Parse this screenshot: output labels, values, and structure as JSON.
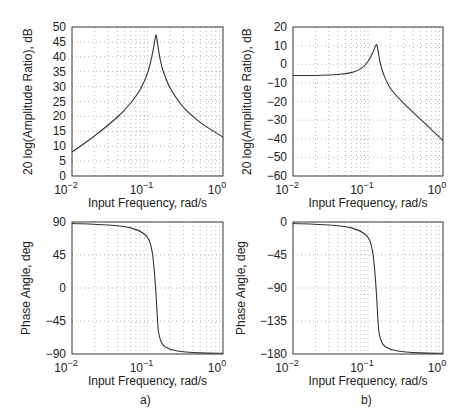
{
  "chart_data": [
    {
      "id": "a-magnitude",
      "type": "line",
      "panel": "a)",
      "title": "",
      "xlabel": "Input Frequency, rad/s",
      "ylabel": "20 log(Amplitude Ratio), dB",
      "xscale": "log",
      "xlim": [
        0.01,
        1
      ],
      "ylim": [
        0,
        50
      ],
      "xticks": [
        "10^-2",
        "10^-1",
        "10^0"
      ],
      "yticks": [
        0,
        5,
        10,
        15,
        20,
        25,
        30,
        35,
        40,
        45,
        50
      ],
      "grid": true,
      "x": [
        0.01,
        0.02,
        0.04,
        0.06,
        0.08,
        0.1,
        0.115,
        0.125,
        0.13,
        0.135,
        0.145,
        0.16,
        0.2,
        0.3,
        0.5,
        1.0
      ],
      "y": [
        8,
        13.5,
        19.8,
        24.5,
        29,
        34.5,
        40.5,
        45.5,
        47.3,
        45,
        40,
        35.5,
        29.5,
        23,
        18,
        13
      ]
    },
    {
      "id": "b-magnitude",
      "type": "line",
      "panel": "b)",
      "title": "",
      "xlabel": "Input Frequency, rad/s",
      "ylabel": "20 log(Amplitude Ratio), dB",
      "xscale": "log",
      "xlim": [
        0.01,
        1
      ],
      "ylim": [
        -60,
        20
      ],
      "xticks": [
        "10^-2",
        "10^-1",
        "10^0"
      ],
      "yticks": [
        20,
        10,
        0,
        -10,
        -20,
        -30,
        -40,
        -50,
        -60
      ],
      "grid": true,
      "x": [
        0.01,
        0.02,
        0.04,
        0.06,
        0.08,
        0.1,
        0.115,
        0.125,
        0.13,
        0.135,
        0.145,
        0.16,
        0.2,
        0.3,
        0.5,
        1.0
      ],
      "y": [
        -6,
        -6,
        -5.5,
        -4.5,
        -2.5,
        1.5,
        6,
        9.5,
        10.5,
        8,
        1,
        -5,
        -13,
        -21,
        -29.5,
        -41
      ]
    },
    {
      "id": "a-phase",
      "type": "line",
      "panel": "a)",
      "title": "",
      "xlabel": "Input Frequency, rad/s",
      "ylabel": "Phase Angle, deg",
      "xscale": "log",
      "xlim": [
        0.01,
        1
      ],
      "ylim": [
        -90,
        90
      ],
      "xticks": [
        "10^-2",
        "10^-1",
        "10^0"
      ],
      "yticks": [
        90,
        45,
        0,
        -45,
        -90
      ],
      "grid": true,
      "x": [
        0.01,
        0.03,
        0.06,
        0.09,
        0.105,
        0.115,
        0.12,
        0.125,
        0.13,
        0.135,
        0.14,
        0.15,
        0.17,
        0.25,
        0.5,
        1.0
      ],
      "y": [
        88,
        86,
        82,
        74,
        65,
        50,
        35,
        15,
        -10,
        -40,
        -60,
        -72,
        -80,
        -86,
        -88.5,
        -89
      ]
    },
    {
      "id": "b-phase",
      "type": "line",
      "panel": "b)",
      "title": "",
      "xlabel": "Input Frequency, rad/s",
      "ylabel": "Phase Angle, deg",
      "xscale": "log",
      "xlim": [
        0.01,
        1
      ],
      "ylim": [
        -180,
        0
      ],
      "xticks": [
        "10^-2",
        "10^-1",
        "10^0"
      ],
      "yticks": [
        0,
        -45,
        -90,
        -135,
        -180
      ],
      "grid": true,
      "x": [
        0.01,
        0.03,
        0.06,
        0.09,
        0.105,
        0.115,
        0.12,
        0.125,
        0.13,
        0.135,
        0.14,
        0.15,
        0.17,
        0.25,
        0.5,
        1.0
      ],
      "y": [
        -2,
        -4,
        -8,
        -16,
        -25,
        -40,
        -55,
        -75,
        -100,
        -130,
        -150,
        -162,
        -170,
        -176,
        -178.5,
        -179
      ]
    }
  ],
  "captions": {
    "left": "a)",
    "right": "b)"
  },
  "layout_boxes": [
    {
      "x": 72,
      "y": 27,
      "w": 151,
      "h": 149
    },
    {
      "x": 293,
      "y": 27,
      "w": 150,
      "h": 149
    },
    {
      "x": 72,
      "y": 222,
      "w": 151,
      "h": 132
    },
    {
      "x": 293,
      "y": 222,
      "w": 150,
      "h": 132
    }
  ]
}
